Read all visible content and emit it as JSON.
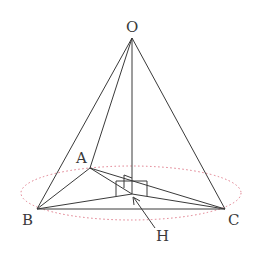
{
  "diagram": {
    "type": "tetrahedron-with-circumcircle",
    "colors": {
      "line": "#3a3a3a",
      "circle": "#e07a8a",
      "background": "#ffffff"
    },
    "points": {
      "O": {
        "label": "O",
        "x": 132,
        "y": 38
      },
      "A": {
        "label": "A",
        "x": 90,
        "y": 168
      },
      "B": {
        "label": "B",
        "x": 37,
        "y": 209
      },
      "C": {
        "label": "C",
        "x": 225,
        "y": 209
      },
      "H": {
        "label": "H",
        "x": 132,
        "y": 194
      }
    },
    "labels": {
      "O": "O",
      "A": "A",
      "B": "B",
      "C": "C",
      "H": "H"
    },
    "edges": [
      [
        "O",
        "A"
      ],
      [
        "O",
        "B"
      ],
      [
        "O",
        "C"
      ],
      [
        "O",
        "H"
      ],
      [
        "A",
        "B"
      ],
      [
        "A",
        "C"
      ],
      [
        "B",
        "C"
      ],
      [
        "A",
        "H"
      ],
      [
        "B",
        "H"
      ],
      [
        "C",
        "H"
      ]
    ],
    "circle": {
      "cx": 131,
      "cy": 193,
      "rx": 110,
      "ry": 27,
      "style": "dotted"
    },
    "right_angle_markers": 2,
    "arrow": {
      "from_label": "H",
      "to_point": "H"
    }
  }
}
